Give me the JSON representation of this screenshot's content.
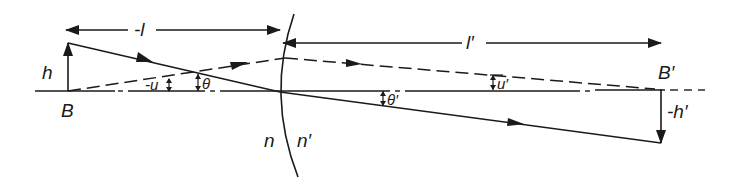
{
  "figure": {
    "colors": {
      "ink": "#1a1a1a",
      "background": "#ffffff"
    }
  },
  "labels": {
    "object_distance": "-l",
    "image_distance": "l′",
    "object_height": "h",
    "image_height": "-h′",
    "object_point": "B",
    "image_point": "B′",
    "object_aperture_angle": "-u",
    "image_aperture_angle": "u′",
    "object_field_angle": "θ",
    "image_field_angle": "θ′",
    "index_before": "n",
    "index_after": "n′"
  },
  "geometry": {
    "axis_y": 91,
    "object_x": 68,
    "object_top_y": 43,
    "vertex_x": 280,
    "image_x": 661,
    "image_bottom_y": 143
  }
}
